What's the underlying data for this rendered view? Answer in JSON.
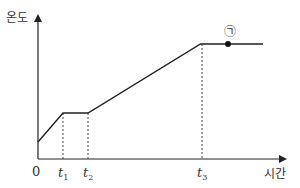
{
  "chart_data": {
    "type": "line",
    "title": "",
    "xlabel": "시간",
    "ylabel": "온도",
    "origin_label": "0",
    "x_ticks": [
      {
        "base": "t",
        "sub": "1",
        "x": 1
      },
      {
        "base": "t",
        "sub": "2",
        "x": 2
      },
      {
        "base": "t",
        "sub": "3",
        "x": 6.5
      }
    ],
    "points": [
      {
        "x": 0,
        "y": 1.0
      },
      {
        "x": 1,
        "y": 2.0
      },
      {
        "x": 2,
        "y": 2.0
      },
      {
        "x": 6.5,
        "y": 4.4
      },
      {
        "x": 9.0,
        "y": 4.4
      }
    ],
    "annotations": [
      {
        "label": "㉠",
        "x": 7.6,
        "y": 4.4,
        "marker": "filled-dot"
      }
    ],
    "dashed_guides": [
      "t1",
      "t2",
      "t3"
    ],
    "grid": false,
    "legend": null
  }
}
